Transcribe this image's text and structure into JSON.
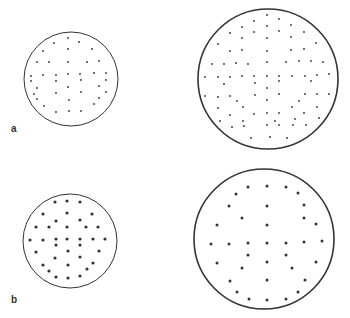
{
  "figure": {
    "panels": [
      {
        "label": "a",
        "label_pos": [
          11,
          124
        ],
        "circles": [
          {
            "name": "small-circle",
            "cx": 71,
            "cy": 79,
            "r": 47,
            "stroke": 1,
            "dot_r": 0.9,
            "dots": [
              [
                68,
                38
              ],
              [
                54,
                43
              ],
              [
                79,
                42
              ],
              [
                43,
                51
              ],
              [
                68,
                49
              ],
              [
                92,
                49
              ],
              [
                37,
                62
              ],
              [
                49,
                62
              ],
              [
                68,
                62
              ],
              [
                87,
                62
              ],
              [
                99,
                61
              ],
              [
                31,
                76
              ],
              [
                43,
                75
              ],
              [
                56,
                75
              ],
              [
                68,
                74
              ],
              [
                80,
                74
              ],
              [
                94,
                73
              ],
              [
                106,
                73
              ],
              [
                31,
                81
              ],
              [
                56,
                81
              ],
              [
                81,
                80
              ],
              [
                106,
                80
              ],
              [
                37,
                88
              ],
              [
                68,
                87
              ],
              [
                99,
                86
              ],
              [
                34,
                94
              ],
              [
                56,
                93
              ],
              [
                81,
                92
              ],
              [
                106,
                92
              ],
              [
                37,
                99
              ],
              [
                69,
                100
              ],
              [
                99,
                98
              ],
              [
                44,
                106
              ],
              [
                94,
                104
              ],
              [
                56,
                112
              ],
              [
                69,
                111
              ],
              [
                81,
                111
              ]
            ]
          },
          {
            "name": "large-circle",
            "cx": 268,
            "cy": 79,
            "r": 70,
            "stroke": 1.6,
            "dot_r": 0.9,
            "dots": [
              [
                267,
                15
              ],
              [
                279,
                19
              ],
              [
                254,
                21
              ],
              [
                242,
                27
              ],
              [
                267,
                26
              ],
              [
                291,
                25
              ],
              [
                230,
                33
              ],
              [
                254,
                32
              ],
              [
                279,
                31
              ],
              [
                304,
                32
              ],
              [
                242,
                38
              ],
              [
                267,
                38
              ],
              [
                291,
                37
              ],
              [
                218,
                44
              ],
              [
                230,
                51
              ],
              [
                242,
                50
              ],
              [
                267,
                51
              ],
              [
                291,
                50
              ],
              [
                304,
                49
              ],
              [
                316,
                43
              ],
              [
                212,
                64
              ],
              [
                224,
                64
              ],
              [
                236,
                63
              ],
              [
                248,
                64
              ],
              [
                267,
                62
              ],
              [
                286,
                62
              ],
              [
                299,
                61
              ],
              [
                311,
                61
              ],
              [
                323,
                62
              ],
              [
                205,
                77
              ],
              [
                218,
                77
              ],
              [
                230,
                77
              ],
              [
                242,
                76
              ],
              [
                254,
                76
              ],
              [
                267,
                76
              ],
              [
                279,
                76
              ],
              [
                292,
                76
              ],
              [
                305,
                76
              ],
              [
                317,
                75
              ],
              [
                329,
                74
              ],
              [
                224,
                84
              ],
              [
                255,
                83
              ],
              [
                279,
                81
              ],
              [
                311,
                81
              ],
              [
                267,
                88
              ],
              [
                255,
                95
              ],
              [
                279,
                94
              ],
              [
                305,
                94
              ],
              [
                317,
                94
              ],
              [
                329,
                94
              ],
              [
                205,
                96
              ],
              [
                218,
                97
              ],
              [
                230,
                96
              ],
              [
                237,
                101
              ],
              [
                267,
                100
              ],
              [
                299,
                101
              ],
              [
                218,
                108
              ],
              [
                243,
                107
              ],
              [
                292,
                107
              ],
              [
                317,
                107
              ],
              [
                230,
                115
              ],
              [
                254,
                114
              ],
              [
                267,
                113
              ],
              [
                279,
                113
              ],
              [
                304,
                113
              ],
              [
                319,
                118
              ],
              [
                220,
                121
              ],
              [
                243,
                121
              ],
              [
                275,
                121
              ],
              [
                295,
                119
              ],
              [
                232,
                127
              ],
              [
                244,
                126
              ],
              [
                267,
                125
              ],
              [
                279,
                125
              ],
              [
                293,
                125
              ],
              [
                306,
                125
              ],
              [
                251,
                138
              ],
              [
                270,
                137
              ],
              [
                287,
                138
              ]
            ]
          }
        ]
      },
      {
        "label": "b",
        "label_pos": [
          11,
          295
        ],
        "circles": [
          {
            "name": "small-circle",
            "cx": 70,
            "cy": 241,
            "r": 47,
            "stroke": 1,
            "dot_r": 1.6,
            "dots": [
              [
                55,
                202
              ],
              [
                67,
                201
              ],
              [
                80,
                202
              ],
              [
                43,
                214
              ],
              [
                67,
                213
              ],
              [
                92,
                214
              ],
              [
                56,
                221
              ],
              [
                80,
                220
              ],
              [
                36,
                227
              ],
              [
                49,
                227
              ],
              [
                67,
                227
              ],
              [
                86,
                227
              ],
              [
                98,
                227
              ],
              [
                30,
                240
              ],
              [
                43,
                240
              ],
              [
                56,
                239
              ],
              [
                67,
                239
              ],
              [
                80,
                239
              ],
              [
                93,
                239
              ],
              [
                105,
                239
              ],
              [
                56,
                245
              ],
              [
                80,
                245
              ],
              [
                36,
                252
              ],
              [
                68,
                251
              ],
              [
                99,
                251
              ],
              [
                55,
                258
              ],
              [
                80,
                257
              ],
              [
                43,
                265
              ],
              [
                68,
                265
              ],
              [
                93,
                263
              ],
              [
                49,
                271
              ],
              [
                87,
                269
              ],
              [
                56,
                277
              ],
              [
                68,
                278
              ],
              [
                80,
                276
              ]
            ]
          },
          {
            "name": "large-circle",
            "cx": 264,
            "cy": 239,
            "r": 70,
            "stroke": 1.6,
            "dot_r": 1.5,
            "dots": [
              [
                248,
                187
              ],
              [
                267,
                186
              ],
              [
                286,
                187
              ],
              [
                236,
                194
              ],
              [
                298,
                193
              ],
              [
                229,
                206
              ],
              [
                267,
                206
              ],
              [
                304,
                205
              ],
              [
                242,
                218
              ],
              [
                304,
                218
              ],
              [
                217,
                225
              ],
              [
                267,
                225
              ],
              [
                316,
                224
              ],
              [
                211,
                244
              ],
              [
                229,
                244
              ],
              [
                248,
                243
              ],
              [
                267,
                243
              ],
              [
                286,
                243
              ],
              [
                304,
                242
              ],
              [
                322,
                241
              ],
              [
                248,
                255
              ],
              [
                286,
                255
              ],
              [
                217,
                263
              ],
              [
                267,
                262
              ],
              [
                316,
                262
              ],
              [
                242,
                268
              ],
              [
                292,
                268
              ],
              [
                230,
                281
              ],
              [
                267,
                280
              ],
              [
                305,
                280
              ],
              [
                237,
                292
              ],
              [
                298,
                292
              ],
              [
                249,
                299
              ],
              [
                267,
                300
              ],
              [
                286,
                299
              ]
            ]
          }
        ]
      }
    ]
  }
}
